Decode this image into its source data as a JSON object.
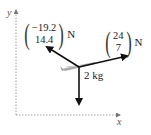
{
  "diagram": {
    "axes": {
      "x_label": "x",
      "y_label": "y"
    },
    "forces": [
      {
        "name": "force-left",
        "components": [
          "−19.2",
          "14.4"
        ],
        "unit": "N"
      },
      {
        "name": "force-right",
        "components": [
          "24",
          "7"
        ],
        "unit": "N"
      },
      {
        "name": "weight",
        "label": ""
      }
    ],
    "mass_label": "2 kg",
    "object": "glider"
  }
}
